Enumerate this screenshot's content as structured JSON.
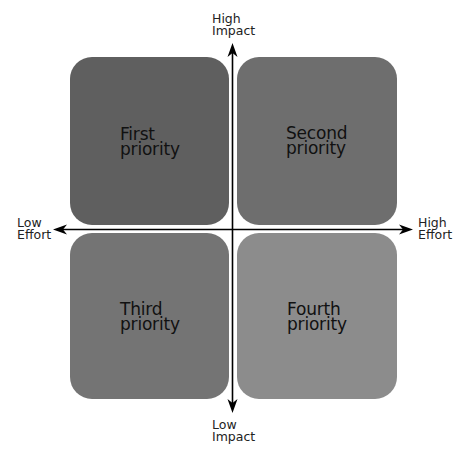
{
  "diagram": {
    "type": "priority-matrix",
    "axes": {
      "x": {
        "low_label_line1": "Low",
        "low_label_line2": "Effort",
        "high_label_line1": "High",
        "high_label_line2": "Effort"
      },
      "y": {
        "high_label_line1": "High",
        "high_label_line2": "Impact",
        "low_label_line1": "Low",
        "low_label_line2": "Impact"
      }
    },
    "quadrants": [
      {
        "line1": "First",
        "line2": "priority",
        "position": "top-left",
        "color": "#5f5f5f"
      },
      {
        "line1": "Second",
        "line2": "priority",
        "position": "top-right",
        "color": "#6e6e6e"
      },
      {
        "line1": "Third",
        "line2": "priority",
        "position": "bottom-left",
        "color": "#747474"
      },
      {
        "line1": "Fourth",
        "line2": "priority",
        "position": "bottom-right",
        "color": "#8c8c8c"
      }
    ]
  }
}
